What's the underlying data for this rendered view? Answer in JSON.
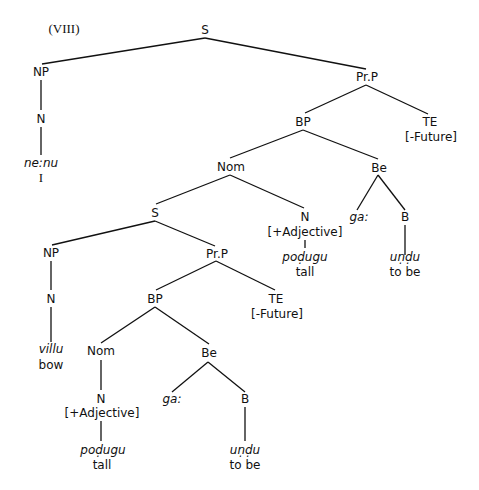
{
  "header": {
    "running_title": ""
  },
  "figure": {
    "label": "(VIII)",
    "nodes": {
      "s_root": "S",
      "np1": "NP",
      "n1": "N",
      "word_nenu": "ne:nu",
      "gloss_i": "I",
      "prp1": "Pr.P",
      "bp1": "BP",
      "te1": "TE",
      "te1_feature": "[-Future]",
      "nom1": "Nom",
      "be1": "Be",
      "s2": "S",
      "n_adj1": "N",
      "n_adj1_feature": "[+Adjective]",
      "word_podugu1": "poḍugu",
      "gloss_tall1": "tall",
      "ga1": "ga:",
      "b1": "B",
      "word_undu1": "uṇḍu",
      "gloss_tobe1": "to be",
      "np2": "NP",
      "n2": "N",
      "word_villu": "villu",
      "gloss_bow": "bow",
      "prp2": "Pr.P",
      "bp2": "BP",
      "te2": "TE",
      "te2_feature": "[-Future]",
      "nom2": "Nom",
      "be2": "Be",
      "n_adj2": "N",
      "n_adj2_feature": "[+Adjective]",
      "word_podugu2": "poḍugu",
      "gloss_tall2": "tall",
      "ga2": "ga:",
      "b2": "B",
      "word_undu2": "uṇḍu",
      "gloss_tobe2": "to be"
    }
  }
}
